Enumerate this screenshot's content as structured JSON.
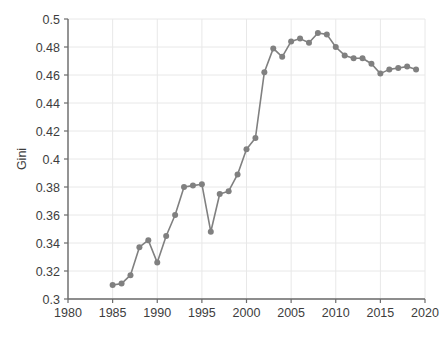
{
  "chart_data": {
    "type": "line",
    "title": "",
    "xlabel": "",
    "ylabel": "Gini",
    "xlim": [
      1980,
      2020
    ],
    "ylim": [
      0.3,
      0.5
    ],
    "grid": true,
    "legend": "none",
    "marker": "circle",
    "series_color": "#808080",
    "x": [
      1985,
      1986,
      1987,
      1988,
      1989,
      1990,
      1991,
      1992,
      1993,
      1994,
      1995,
      1996,
      1997,
      1998,
      1999,
      2000,
      2001,
      2002,
      2003,
      2004,
      2005,
      2006,
      2007,
      2008,
      2009,
      2010,
      2011,
      2012,
      2013,
      2014,
      2015,
      2016,
      2017,
      2018,
      2019
    ],
    "values": [
      0.31,
      0.311,
      0.317,
      0.337,
      0.342,
      0.326,
      0.345,
      0.36,
      0.38,
      0.381,
      0.382,
      0.348,
      0.375,
      0.377,
      0.389,
      0.407,
      0.415,
      0.462,
      0.479,
      0.473,
      0.484,
      0.486,
      0.483,
      0.49,
      0.489,
      0.48,
      0.474,
      0.472,
      0.472,
      0.468,
      0.461,
      0.464,
      0.465,
      0.466,
      0.464
    ],
    "xticks": [
      1980,
      1985,
      1990,
      1995,
      2000,
      2005,
      2010,
      2015,
      2020
    ],
    "xtick_labels": [
      "1980",
      "1985",
      "1990",
      "1995",
      "2000",
      "2005",
      "2010",
      "2015",
      "2020"
    ],
    "yticks": [
      0.3,
      0.32,
      0.34,
      0.36,
      0.38,
      0.4,
      0.42,
      0.44,
      0.46,
      0.48,
      0.5
    ],
    "ytick_labels": [
      "0.3",
      "0.32",
      "0.34",
      "0.36",
      "0.38",
      "0.4",
      "0.42",
      "0.44",
      "0.46",
      "0.48",
      "0.5"
    ]
  },
  "style": {
    "grid_color": "#e8e8e8",
    "axis_color": "#6b6b6b",
    "text_color": "#3d3d3d",
    "background": "#ffffff"
  }
}
